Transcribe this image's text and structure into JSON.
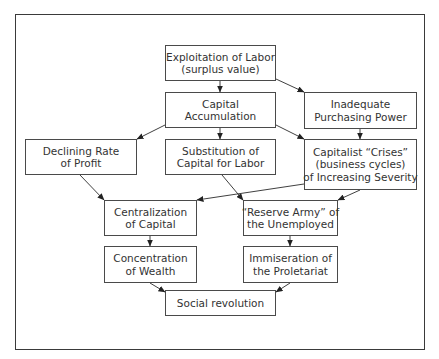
{
  "diagram": {
    "nodes": [
      {
        "id": "exploitation",
        "lines": [
          "Exploitation of Labor",
          "(surplus value)"
        ]
      },
      {
        "id": "capital_accumulation",
        "lines": [
          "Capital",
          "Accumulation"
        ]
      },
      {
        "id": "inadequate_purchasing",
        "lines": [
          "Inadequate",
          "Purchasing Power"
        ]
      },
      {
        "id": "declining_rate",
        "lines": [
          "Declining Rate",
          "of Profit"
        ]
      },
      {
        "id": "substitution",
        "lines": [
          "Substitution of",
          "Capital for Labor"
        ]
      },
      {
        "id": "crises",
        "lines": [
          "Capitalist “Crises”",
          "(business cycles)",
          "of Increasing Severity"
        ]
      },
      {
        "id": "centralization",
        "lines": [
          "Centralization",
          "of Capital"
        ]
      },
      {
        "id": "reserve_army",
        "lines": [
          "“Reserve Army” of",
          "the Unemployed"
        ]
      },
      {
        "id": "concentration",
        "lines": [
          "Concentration",
          "of Wealth"
        ]
      },
      {
        "id": "immiseration",
        "lines": [
          "Immiseration of",
          "the Proletariat"
        ]
      },
      {
        "id": "social_revolution",
        "lines": [
          "Social revolution"
        ]
      }
    ],
    "edges": [
      {
        "from": "exploitation",
        "to": "capital_accumulation"
      },
      {
        "from": "exploitation",
        "to": "inadequate_purchasing"
      },
      {
        "from": "capital_accumulation",
        "to": "declining_rate"
      },
      {
        "from": "capital_accumulation",
        "to": "substitution"
      },
      {
        "from": "capital_accumulation",
        "to": "crises"
      },
      {
        "from": "inadequate_purchasing",
        "to": "crises"
      },
      {
        "from": "declining_rate",
        "to": "centralization"
      },
      {
        "from": "crises",
        "to": "centralization"
      },
      {
        "from": "substitution",
        "to": "reserve_army"
      },
      {
        "from": "crises",
        "to": "reserve_army"
      },
      {
        "from": "centralization",
        "to": "concentration"
      },
      {
        "from": "reserve_army",
        "to": "immiseration"
      },
      {
        "from": "concentration",
        "to": "social_revolution"
      },
      {
        "from": "immiseration",
        "to": "social_revolution"
      }
    ]
  }
}
